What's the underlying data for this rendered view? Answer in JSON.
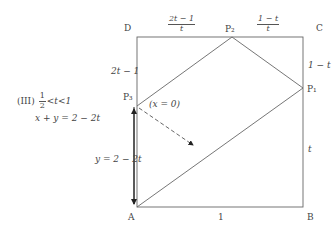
{
  "case": {
    "label": "(III)",
    "frac_num": "1",
    "frac_den": "2",
    "inequality_rest": "<t<1",
    "equation": "x + y = 2 − 2t"
  },
  "vertices": {
    "A": "A",
    "B": "B",
    "C": "C",
    "D": "D"
  },
  "points": {
    "P1": "P₁",
    "P2": "P₂",
    "P3": "P₃"
  },
  "segment_labels": {
    "DP3": "2t − 1",
    "CP1": "1 − t",
    "BP1": "t",
    "AB": "1",
    "DP2": {
      "num": "2t − 1",
      "den": "t"
    },
    "P2C": {
      "num": "1 − t",
      "den": "t"
    },
    "AP3": "y = 2 − 2t",
    "P3_note": "(x = 0)"
  },
  "geometry": {
    "square": {
      "x": 137,
      "y": 37,
      "w": 166,
      "h": 170
    },
    "P1": [
      303,
      88
    ],
    "P2": [
      232,
      37
    ],
    "P3": [
      137,
      106
    ],
    "A": [
      137,
      207
    ],
    "colors": {
      "square": "#666666",
      "path": "#666666",
      "arrow": "#222222",
      "dashed": "#555555"
    }
  }
}
